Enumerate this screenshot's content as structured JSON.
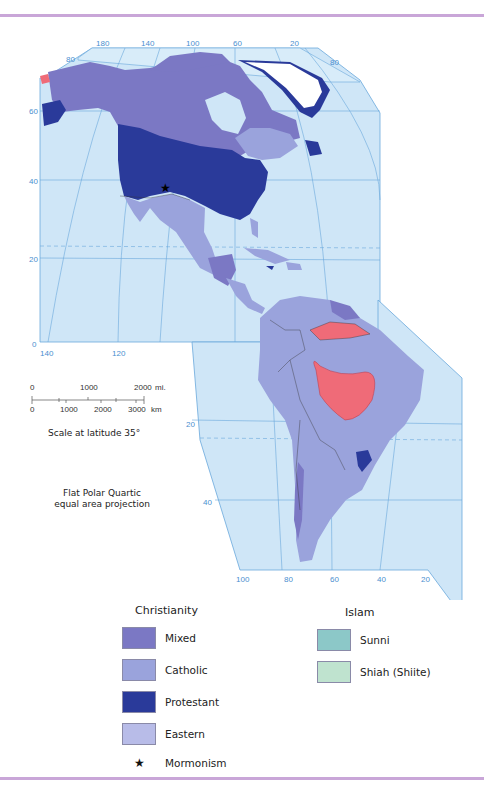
{
  "map": {
    "projection_note": [
      "Flat Polar Quartic",
      "equal area projection"
    ],
    "scale": {
      "miles_labels": [
        "0",
        "1000",
        "2000"
      ],
      "miles_unit": "mi.",
      "km_labels": [
        "0",
        "1000",
        "2000",
        "3000"
      ],
      "km_unit": "km",
      "caption": "Scale at latitude 35°"
    },
    "graticule_labels": {
      "top_longitudes": [
        "180",
        "140",
        "100",
        "60",
        "20"
      ],
      "north_lat_left": [
        "80",
        "60",
        "40",
        "20",
        "0"
      ],
      "north_lat_right": [
        "80"
      ],
      "mid_longitudes": [
        "140",
        "120"
      ],
      "south_lat": [
        "20",
        "40"
      ],
      "bottom_longitudes": [
        "100",
        "80",
        "60",
        "40",
        "20"
      ]
    },
    "colors": {
      "ocean": "#cfe6f7",
      "graticule": "#6aa8dc",
      "mixed": "#7b78c4",
      "catholic": "#9aa3dc",
      "protestant": "#2a3a9a",
      "eastern": "#b3b6e6",
      "hindu_red": "#ef6b78",
      "ice": "#ffffff"
    },
    "symbols": {
      "mormonism_star": "★"
    }
  },
  "legend": {
    "christianity": {
      "title": "Christianity",
      "items": [
        {
          "label": "Mixed",
          "color": "#7b78c4"
        },
        {
          "label": "Catholic",
          "color": "#9aa3dc"
        },
        {
          "label": "Protestant",
          "color": "#2a3a9a"
        },
        {
          "label": "Eastern",
          "color": "#b8bce8"
        }
      ],
      "symbol_item": {
        "symbol": "★",
        "label": "Mormonism"
      }
    },
    "islam": {
      "title": "Islam",
      "items": [
        {
          "label": "Sunni",
          "color": "#8cc8c8"
        },
        {
          "label": "Shiah (Shiite)",
          "color": "#bfe3cf"
        }
      ]
    }
  }
}
